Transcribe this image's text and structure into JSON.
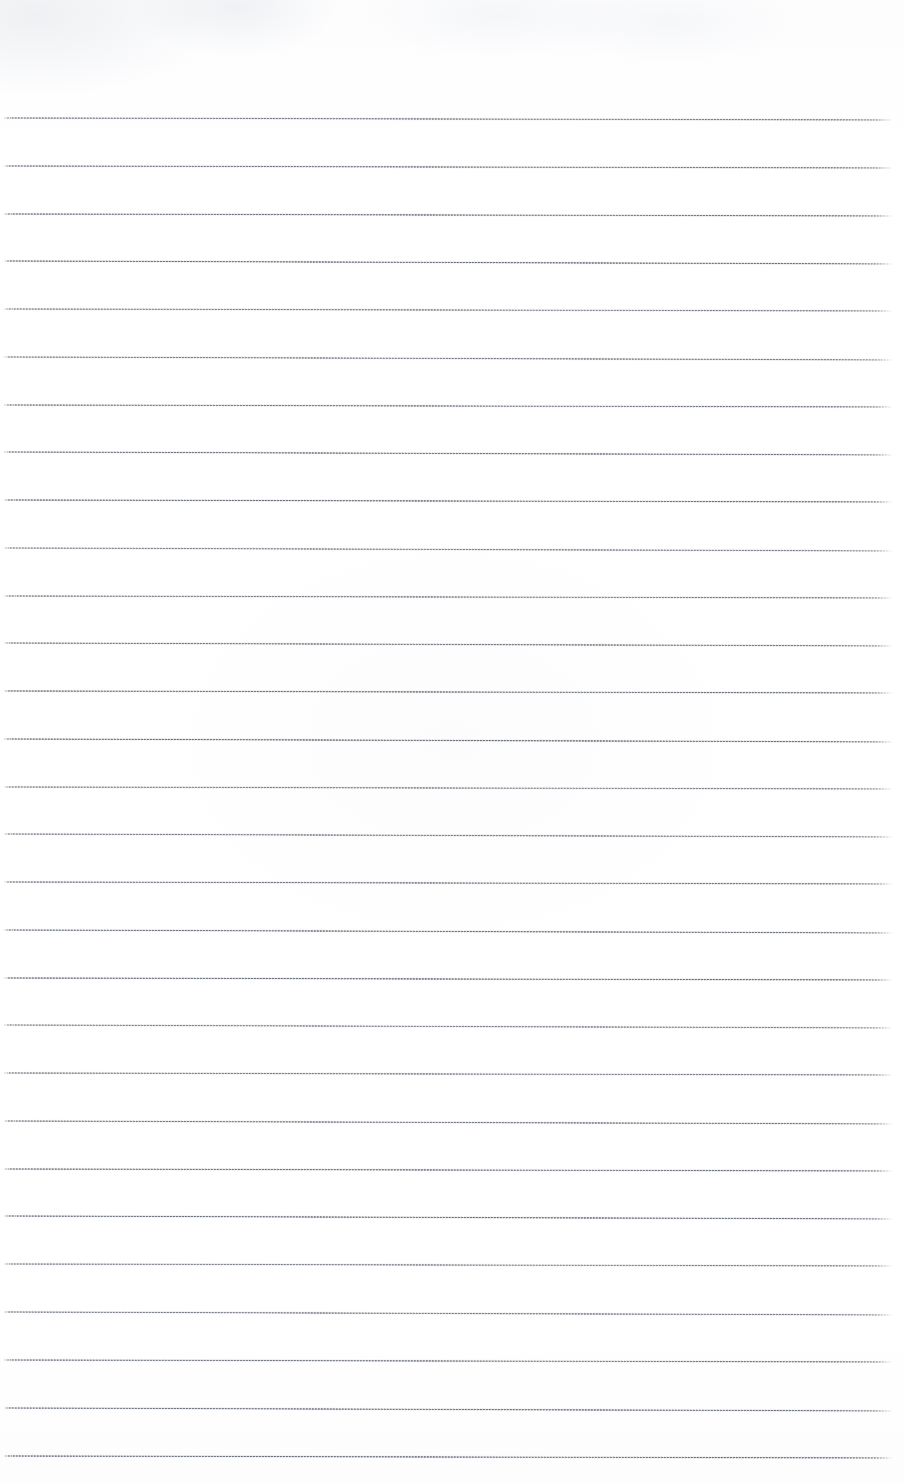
{
  "document": {
    "kind": "scanned-ruled-notepad-page",
    "title": "",
    "visible_text": "",
    "has_text_content": false,
    "page_width": 904,
    "page_height": 1483,
    "background_color": "#ffffff",
    "rule_color": "#6c7380",
    "rule_thickness_px": 2,
    "rule_count": 29,
    "first_rule_y": 118,
    "rule_spacing_px": 47.8,
    "last_rule_y": 1456,
    "rule_start_x": 3,
    "rule_end_x": 893,
    "rule_slope_px": 4,
    "top_margin_px": 118,
    "bottom_margin_px": 27,
    "left_margin_px": 3,
    "right_margin_px": 11,
    "texture": "dithered-halftone",
    "edges_fade": true
  },
  "rules": [
    {
      "index": 1,
      "y": 118,
      "left_x": 3,
      "right_x": 893,
      "tilt": 2
    },
    {
      "index": 2,
      "y": 166,
      "left_x": 3,
      "right_x": 893,
      "tilt": 2
    },
    {
      "index": 3,
      "y": 214,
      "left_x": 3,
      "right_x": 893,
      "tilt": 2
    },
    {
      "index": 4,
      "y": 261,
      "left_x": 3,
      "right_x": 893,
      "tilt": 3
    },
    {
      "index": 5,
      "y": 309,
      "left_x": 3,
      "right_x": 893,
      "tilt": 2
    },
    {
      "index": 6,
      "y": 357,
      "left_x": 3,
      "right_x": 893,
      "tilt": 3
    },
    {
      "index": 7,
      "y": 405,
      "left_x": 3,
      "right_x": 893,
      "tilt": 2
    },
    {
      "index": 8,
      "y": 452,
      "left_x": 3,
      "right_x": 893,
      "tilt": 3
    },
    {
      "index": 9,
      "y": 500,
      "left_x": 3,
      "right_x": 893,
      "tilt": 2
    },
    {
      "index": 10,
      "y": 548,
      "left_x": 3,
      "right_x": 893,
      "tilt": 3
    },
    {
      "index": 11,
      "y": 596,
      "left_x": 3,
      "right_x": 893,
      "tilt": 2
    },
    {
      "index": 12,
      "y": 643,
      "left_x": 3,
      "right_x": 893,
      "tilt": 3
    },
    {
      "index": 13,
      "y": 691,
      "left_x": 3,
      "right_x": 893,
      "tilt": 2
    },
    {
      "index": 14,
      "y": 739,
      "left_x": 3,
      "right_x": 893,
      "tilt": 3
    },
    {
      "index": 15,
      "y": 787,
      "left_x": 3,
      "right_x": 893,
      "tilt": 2
    },
    {
      "index": 16,
      "y": 834,
      "left_x": 3,
      "right_x": 893,
      "tilt": 3
    },
    {
      "index": 17,
      "y": 882,
      "left_x": 3,
      "right_x": 893,
      "tilt": 2
    },
    {
      "index": 18,
      "y": 930,
      "left_x": 3,
      "right_x": 893,
      "tilt": 3
    },
    {
      "index": 19,
      "y": 978,
      "left_x": 3,
      "right_x": 893,
      "tilt": 2
    },
    {
      "index": 20,
      "y": 1025,
      "left_x": 3,
      "right_x": 893,
      "tilt": 3
    },
    {
      "index": 21,
      "y": 1073,
      "left_x": 3,
      "right_x": 893,
      "tilt": 2
    },
    {
      "index": 22,
      "y": 1121,
      "left_x": 3,
      "right_x": 893,
      "tilt": 3
    },
    {
      "index": 23,
      "y": 1169,
      "left_x": 3,
      "right_x": 893,
      "tilt": 2
    },
    {
      "index": 24,
      "y": 1216,
      "left_x": 3,
      "right_x": 893,
      "tilt": 3
    },
    {
      "index": 25,
      "y": 1264,
      "left_x": 3,
      "right_x": 893,
      "tilt": 2
    },
    {
      "index": 26,
      "y": 1312,
      "left_x": 3,
      "right_x": 893,
      "tilt": 3
    },
    {
      "index": 27,
      "y": 1360,
      "left_x": 3,
      "right_x": 893,
      "tilt": 2
    },
    {
      "index": 28,
      "y": 1408,
      "left_x": 3,
      "right_x": 893,
      "tilt": 3
    },
    {
      "index": 29,
      "y": 1456,
      "left_x": 3,
      "right_x": 893,
      "tilt": 2
    }
  ]
}
